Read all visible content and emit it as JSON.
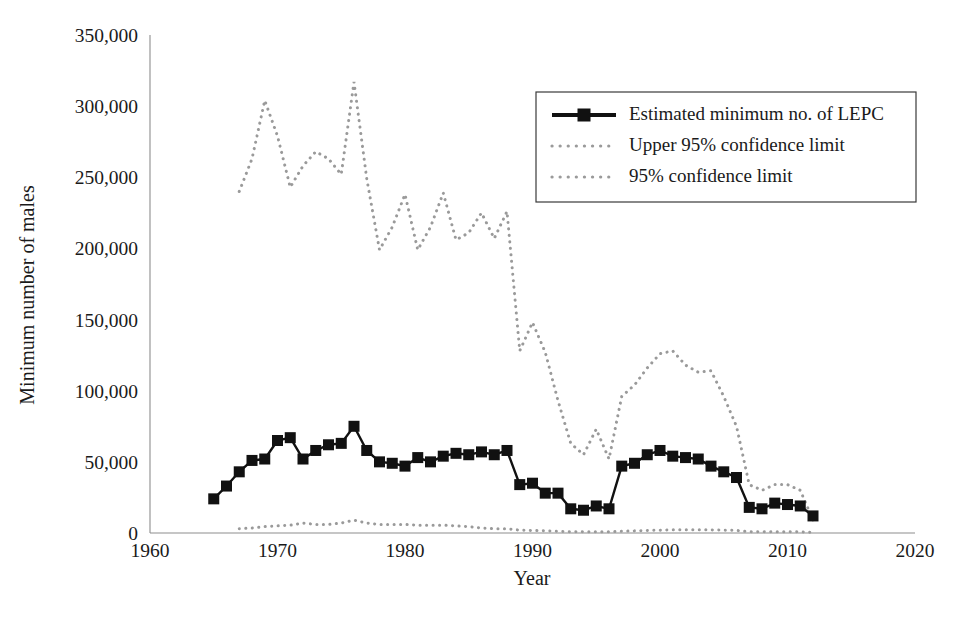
{
  "chart_data": {
    "type": "line",
    "title": "",
    "xlabel": "Year",
    "ylabel": "Minimum number of males",
    "xlim": [
      1960,
      2020
    ],
    "ylim": [
      0,
      350000
    ],
    "xticks": [
      1960,
      1970,
      1980,
      1990,
      2000,
      2010,
      2020
    ],
    "xtick_labels": [
      "1960",
      "1970",
      "1980",
      "1990",
      "2000",
      "2010",
      "2020"
    ],
    "yticks": [
      0,
      50000,
      100000,
      150000,
      200000,
      250000,
      300000,
      350000
    ],
    "ytick_labels": [
      "0",
      "50,000",
      "100,000",
      "150,000",
      "200,000",
      "250,000",
      "300,000",
      "350,000"
    ],
    "grid": false,
    "legend_position": "top-right",
    "x": [
      1965,
      1966,
      1967,
      1968,
      1969,
      1970,
      1971,
      1972,
      1973,
      1974,
      1975,
      1976,
      1977,
      1978,
      1979,
      1980,
      1981,
      1982,
      1983,
      1984,
      1985,
      1986,
      1987,
      1988,
      1989,
      1990,
      1991,
      1992,
      1993,
      1994,
      1995,
      1996,
      1997,
      1998,
      1999,
      2000,
      2001,
      2002,
      2003,
      2004,
      2005,
      2006,
      2007,
      2008,
      2009,
      2010,
      2011,
      2012
    ],
    "series": [
      {
        "name": "Estimated minimum no. of LEPC",
        "style": "solid-with-square-markers",
        "color": "#111111",
        "values": [
          24000,
          33000,
          43000,
          51000,
          52000,
          65000,
          67000,
          52000,
          58000,
          62000,
          63000,
          75000,
          58000,
          50000,
          49000,
          47000,
          53000,
          50000,
          54000,
          56000,
          55000,
          57000,
          55000,
          58000,
          34000,
          35000,
          28000,
          28000,
          17000,
          16000,
          19000,
          17000,
          47000,
          49000,
          55000,
          58000,
          54000,
          53000,
          52000,
          47000,
          43000,
          39000,
          18000,
          17000,
          21000,
          20000,
          19000,
          12000
        ]
      },
      {
        "name": "Upper 95% confidence limit",
        "style": "dotted",
        "color": "#9a9a9a",
        "values": [
          null,
          null,
          240000,
          263000,
          304000,
          279000,
          243000,
          258000,
          268000,
          263000,
          252000,
          317000,
          249000,
          199000,
          215000,
          238000,
          199000,
          215000,
          239000,
          206000,
          211000,
          225000,
          207000,
          226000,
          128000,
          148000,
          127000,
          93000,
          63000,
          55000,
          73000,
          52000,
          96000,
          104000,
          116000,
          126000,
          128000,
          118000,
          113000,
          114000,
          96000,
          75000,
          34000,
          30000,
          34000,
          34000,
          30000,
          9000
        ]
      },
      {
        "name": "95% confidence limit",
        "style": "dotted",
        "color": "#9a9a9a",
        "values": [
          null,
          null,
          3000,
          3500,
          4500,
          5000,
          5500,
          7000,
          6000,
          6000,
          7000,
          9000,
          7000,
          6000,
          6000,
          6000,
          5500,
          5500,
          5500,
          5000,
          4500,
          3500,
          3000,
          3000,
          2000,
          1800,
          1500,
          1200,
          900,
          800,
          800,
          800,
          1200,
          1500,
          1800,
          2000,
          2200,
          2200,
          2200,
          2200,
          2000,
          1800,
          900,
          800,
          900,
          900,
          800,
          500
        ]
      }
    ]
  },
  "legend": {
    "items": [
      {
        "label": "Estimated minimum no. of LEPC",
        "marker": "line-with-square-marker"
      },
      {
        "label": "Upper 95% confidence limit",
        "marker": "dotted-line"
      },
      {
        "label": "95% confidence limit",
        "marker": "dotted-line"
      }
    ]
  },
  "colors": {
    "series_main": "#111111",
    "series_ci": "#9a9a9a",
    "axis": "#8d8d8d",
    "text": "#1a1a1a",
    "background": "#ffffff"
  }
}
